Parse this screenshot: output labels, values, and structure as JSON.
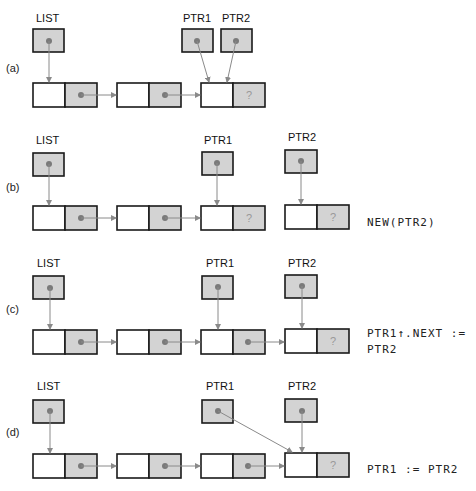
{
  "diagram": {
    "colors": {
      "shaded_cell": "#d3d3d3",
      "border": "#1a1a1a",
      "arrow": "#8a8a8a",
      "dot": "#7a7a7a"
    },
    "panels": [
      {
        "id": "a",
        "label": "(a)",
        "pointer_labels": [
          "LIST",
          "PTR1",
          "PTR2"
        ],
        "unknown_mark": "?",
        "statement": ""
      },
      {
        "id": "b",
        "label": "(b)",
        "pointer_labels": [
          "LIST",
          "PTR1",
          "PTR2"
        ],
        "unknown_mark": "?",
        "statement": "NEW(PTR2)"
      },
      {
        "id": "c",
        "label": "(c)",
        "pointer_labels": [
          "LIST",
          "PTR1",
          "PTR2"
        ],
        "unknown_mark": "?",
        "statement_line1": "PTR1↑.NEXT :=",
        "statement_line2": "PTR2"
      },
      {
        "id": "d",
        "label": "(d)",
        "pointer_labels": [
          "LIST",
          "PTR1",
          "PTR2"
        ],
        "unknown_mark": "?",
        "statement": "PTR1 := PTR2"
      }
    ]
  }
}
